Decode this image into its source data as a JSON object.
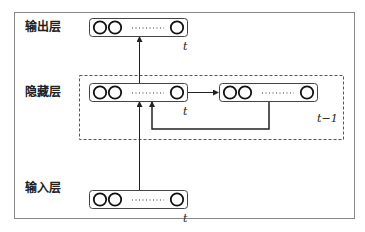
{
  "diagram": {
    "type": "recurrent-neural-network-architecture",
    "layers": {
      "output": {
        "label": "输出层",
        "time_label": "t"
      },
      "hidden": {
        "label": "隐藏层",
        "time_label": "t",
        "prev_time_label": "t−1"
      },
      "input": {
        "label": "输入层",
        "time_label": "t"
      }
    },
    "edges": [
      {
        "from": "input_t",
        "to": "hidden_t"
      },
      {
        "from": "hidden_t",
        "to": "output_t"
      },
      {
        "from": "hidden_t",
        "to": "hidden_t-1"
      },
      {
        "from": "hidden_t-1",
        "to": "hidden_t",
        "style": "feedback-loop"
      }
    ],
    "node_ellipsis": "··········",
    "colors": {
      "stroke": "#222222",
      "frame": "#888888",
      "dashed": "#555555",
      "background": "#ffffff"
    }
  }
}
